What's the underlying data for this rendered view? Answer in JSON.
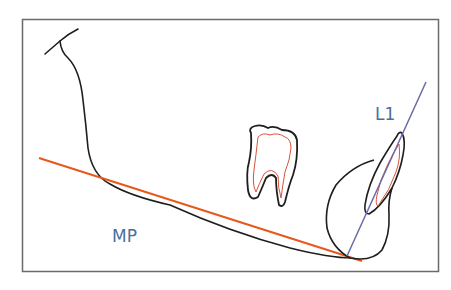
{
  "diagram": {
    "labels": {
      "l1": "L1",
      "mp": "MP"
    },
    "colors": {
      "outline": "#1e1e1e",
      "frame": "#6a6a6a",
      "mandibular_plane": "#e8581c",
      "incisor_axis": "#6a6aa8",
      "pulp": "#d9533a",
      "label": "#4a6f9c"
    }
  }
}
